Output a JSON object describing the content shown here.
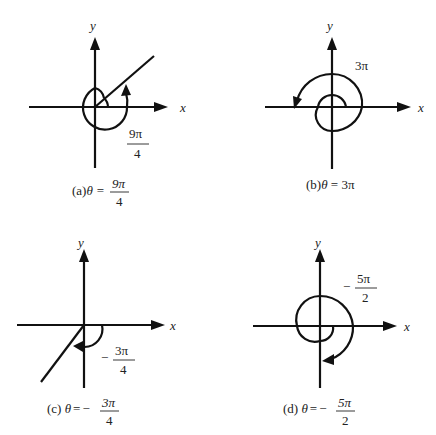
{
  "figure": {
    "panels": [
      {
        "id": "a",
        "axis_x_label": "x",
        "axis_y_label": "y",
        "angle_label_num": "9π",
        "angle_label_den": "4",
        "angle_label_sign": "",
        "caption_prefix": "(a)",
        "caption_theta": "θ",
        "caption_eq": "=",
        "caption_sign": "",
        "caption_num": "9π",
        "caption_den": "4",
        "rotation": "counterclockwise"
      },
      {
        "id": "b",
        "axis_x_label": "x",
        "axis_y_label": "y",
        "angle_label": "3π",
        "caption_prefix": "(b)",
        "caption_theta": "θ",
        "caption_rest": " = 3π",
        "rotation": "counterclockwise"
      },
      {
        "id": "c",
        "axis_x_label": "x",
        "axis_y_label": "y",
        "angle_label_sign": "−",
        "angle_label_num": "3π",
        "angle_label_den": "4",
        "caption_prefix": "(c) ",
        "caption_theta": "θ",
        "caption_eq": "=",
        "caption_sign": "−",
        "caption_num": "3π",
        "caption_den": "4",
        "rotation": "clockwise"
      },
      {
        "id": "d",
        "axis_x_label": "x",
        "axis_y_label": "y",
        "angle_label_sign": "−",
        "angle_label_num": "5π",
        "angle_label_den": "2",
        "caption_prefix": "(d) ",
        "caption_theta": "θ",
        "caption_eq": "=",
        "caption_sign": "−",
        "caption_num": "5π",
        "caption_den": "2",
        "rotation": "clockwise"
      }
    ]
  }
}
